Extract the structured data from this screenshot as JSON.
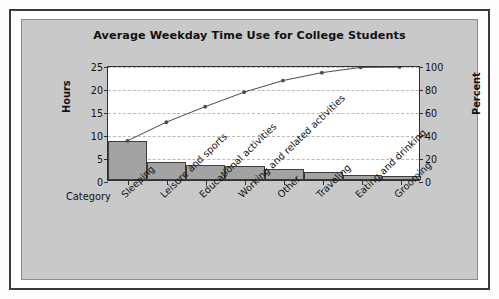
{
  "figure": {
    "frame_color": "#3a3a3a",
    "panel_color": "#c9c9c9",
    "plot_background": "#ffffff",
    "bar_fill": "#a3a3a3",
    "bar_outline": "#3d3d3d",
    "line_color": "#4a4a4a",
    "gridline_color": "#b9b9b9"
  },
  "labels": {
    "category_axis_title": "Category",
    "hours_axis_title": "Hours",
    "percent_axis_title": "Percent"
  },
  "chart_data": {
    "type": "bar",
    "title": "Average Weekday Time Use for College Students",
    "xlabel": "Category",
    "ylabel": "Hours",
    "y2label": "Percent",
    "ylim": [
      0,
      25
    ],
    "y2lim": [
      0,
      100
    ],
    "yticks": [
      "0",
      "5",
      "10",
      "15",
      "20",
      "25"
    ],
    "ytick_values": [
      0,
      5,
      10,
      15,
      20,
      25
    ],
    "y2ticks": [
      "0",
      "20",
      "40",
      "60",
      "80",
      "100"
    ],
    "y2tick_values": [
      0,
      20,
      40,
      60,
      80,
      100
    ],
    "grid": true,
    "legend": "none",
    "categories": [
      "Sleeping",
      "Leisure and sports",
      "Educational activities",
      "Working and related activities",
      "Other",
      "Traveling",
      "Eating and drinking",
      "Grooming"
    ],
    "series": [
      {
        "name": "Hours",
        "type": "bar",
        "axis": "left",
        "values": [
          8.4,
          4.0,
          3.3,
          3.1,
          2.5,
          1.7,
          1.1,
          0.8
        ]
      },
      {
        "name": "Cumulative Percent",
        "type": "line",
        "axis": "right",
        "values": [
          34.7,
          51.2,
          64.9,
          77.7,
          88.0,
          95.0,
          99.6,
          100.0
        ]
      }
    ]
  }
}
